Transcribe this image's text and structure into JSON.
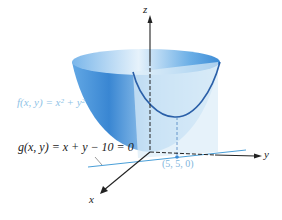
{
  "figure": {
    "type": "3d-surface-with-constraint",
    "labels": {
      "surface": "f(x, y) = x² + y²",
      "constraint": "g(x, y) = x + y − 10 = 0",
      "point": "(5, 5, 0)",
      "axis_x": "x",
      "axis_y": "y",
      "axis_z": "z"
    },
    "colors": {
      "surface_dark": "#2f80d0",
      "surface_light": "#cfe6f7",
      "plane": "#dcecf8",
      "curve": "#2a5fa8",
      "line": "#4a9fd8",
      "f_label": "#8fc3e6",
      "point_label": "#7fb6dc",
      "axes": "#222222"
    }
  }
}
